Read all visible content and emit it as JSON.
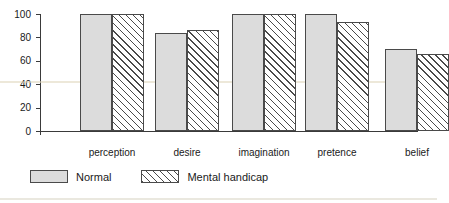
{
  "chart_data": {
    "type": "bar",
    "title": "",
    "subtitle": "",
    "xlabel": "",
    "ylabel": "",
    "ylim": [
      0,
      100
    ],
    "yticks": [
      0,
      20,
      40,
      60,
      80,
      100
    ],
    "ytick_labels": [
      "0",
      "20",
      "40",
      "60",
      "80",
      "100"
    ],
    "grid": false,
    "legend_position": "bottom-left",
    "categories": [
      "perception",
      "desire",
      "imagination",
      "pretence",
      "belief"
    ],
    "series": [
      {
        "name": "Normal",
        "fill": "solid-gray",
        "color": "#dcdcdc",
        "values": [
          100,
          84,
          100,
          100,
          70
        ]
      },
      {
        "name": "Mental handicap",
        "fill": "diagonal-hatch",
        "color": "#ffffff",
        "values": [
          100,
          86,
          100,
          93,
          66
        ]
      }
    ]
  },
  "legend": {
    "items": [
      {
        "label": "Normal"
      },
      {
        "label": "Mental handicap"
      }
    ]
  }
}
